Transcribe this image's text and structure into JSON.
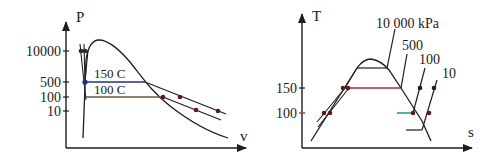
{
  "diagrams": [
    {
      "id": "pv",
      "x_axis_label": "v",
      "y_axis_label": "P",
      "y_ticks": [
        "10000",
        "500",
        "100",
        "10"
      ],
      "isotherm_labels": [
        "150 C",
        "100 C"
      ],
      "colors": {
        "curve": "#1e1e1e",
        "isotherm_150": "#1f2f8a",
        "isotherm_100": "#6a5a40",
        "point": "#5a1a1a"
      }
    },
    {
      "id": "ts",
      "x_axis_label": "s",
      "y_axis_label": "T",
      "y_ticks": [
        "150",
        "100"
      ],
      "isobar_labels": [
        "10 000 kPa",
        "500",
        "100",
        "10"
      ],
      "colors": {
        "curve": "#1e1e1e",
        "tick_100": "#d0202a",
        "line_150": "#b0204a",
        "line_100": "#0aa0a0",
        "point": "#5a1a1a"
      }
    }
  ]
}
